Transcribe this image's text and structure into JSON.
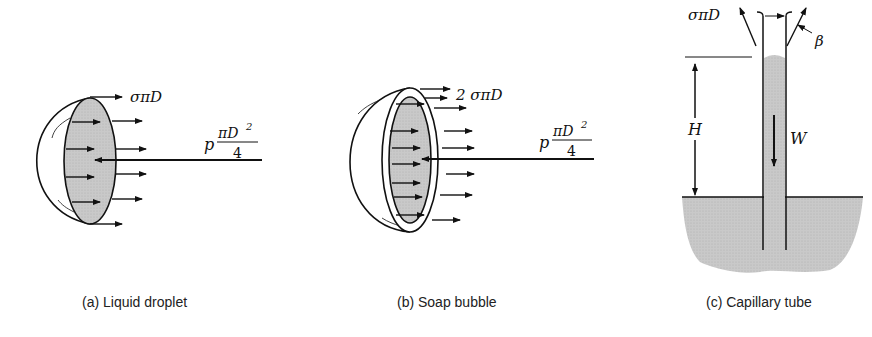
{
  "figure": {
    "panels": [
      {
        "id": "a",
        "caption": "(a)  Liquid droplet",
        "labels": {
          "surface_force": "σπD",
          "pressure_force_prefix": "p",
          "pressure_force_num": "πD",
          "pressure_force_exp": "2",
          "pressure_force_den": "4"
        }
      },
      {
        "id": "b",
        "caption": "(b)  Soap bubble",
        "labels": {
          "surface_force": "2 σπD",
          "pressure_force_prefix": "p",
          "pressure_force_num": "πD",
          "pressure_force_exp": "2",
          "pressure_force_den": "4"
        }
      },
      {
        "id": "c",
        "caption": "(c)  Capillary tube",
        "labels": {
          "surface_force": "σπD",
          "contact_angle": "β",
          "height": "H",
          "weight": "W"
        }
      }
    ],
    "colors": {
      "ink": "#111111",
      "fill": "#c8c8c8",
      "background": "#ffffff"
    }
  }
}
